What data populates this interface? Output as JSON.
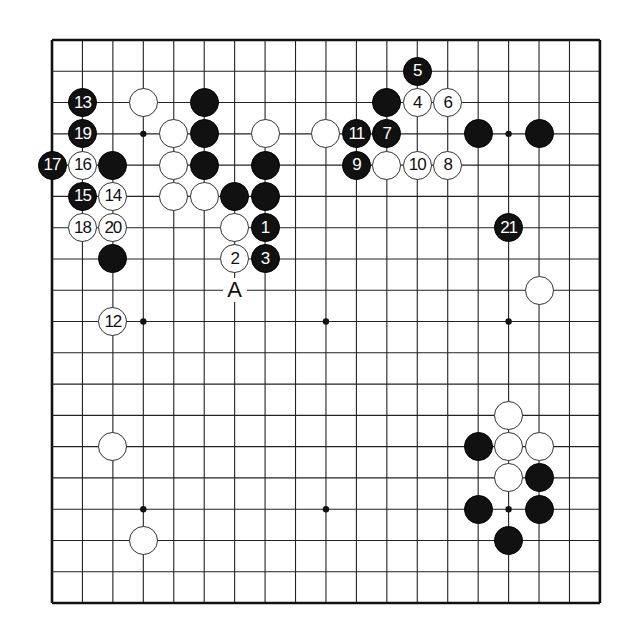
{
  "board": {
    "size": 19,
    "origin": {
      "x": 52,
      "y": 40
    },
    "spacing": {
      "x": 30.44,
      "y": 31.28
    },
    "line_color": "#222222",
    "border_color": "#111111",
    "star_points": [
      [
        3,
        3
      ],
      [
        9,
        3
      ],
      [
        15,
        3
      ],
      [
        3,
        9
      ],
      [
        9,
        9
      ],
      [
        15,
        9
      ],
      [
        3,
        15
      ],
      [
        9,
        15
      ],
      [
        15,
        15
      ]
    ]
  },
  "stones": [
    {
      "color": "black",
      "col": 12,
      "row": 1,
      "number": "5"
    },
    {
      "color": "black",
      "col": 1,
      "row": 2,
      "number": "13"
    },
    {
      "color": "white",
      "col": 3,
      "row": 2,
      "number": ""
    },
    {
      "color": "black",
      "col": 5,
      "row": 2,
      "number": ""
    },
    {
      "color": "black",
      "col": 11,
      "row": 2,
      "number": ""
    },
    {
      "color": "white",
      "col": 12,
      "row": 2,
      "number": "4"
    },
    {
      "color": "white",
      "col": 13,
      "row": 2,
      "number": "6"
    },
    {
      "color": "black",
      "col": 1,
      "row": 3,
      "number": "19"
    },
    {
      "color": "white",
      "col": 4,
      "row": 3,
      "number": ""
    },
    {
      "color": "black",
      "col": 5,
      "row": 3,
      "number": ""
    },
    {
      "color": "white",
      "col": 7,
      "row": 3,
      "number": ""
    },
    {
      "color": "white",
      "col": 9,
      "row": 3,
      "number": ""
    },
    {
      "color": "black",
      "col": 10,
      "row": 3,
      "number": "11"
    },
    {
      "color": "black",
      "col": 11,
      "row": 3,
      "number": "7"
    },
    {
      "color": "black",
      "col": 14,
      "row": 3,
      "number": ""
    },
    {
      "color": "black",
      "col": 16,
      "row": 3,
      "number": ""
    },
    {
      "color": "black",
      "col": 0,
      "row": 4,
      "number": "17"
    },
    {
      "color": "white",
      "col": 1,
      "row": 4,
      "number": "16"
    },
    {
      "color": "black",
      "col": 2,
      "row": 4,
      "number": ""
    },
    {
      "color": "white",
      "col": 4,
      "row": 4,
      "number": ""
    },
    {
      "color": "black",
      "col": 5,
      "row": 4,
      "number": ""
    },
    {
      "color": "black",
      "col": 7,
      "row": 4,
      "number": ""
    },
    {
      "color": "black",
      "col": 10,
      "row": 4,
      "number": "9"
    },
    {
      "color": "white",
      "col": 11,
      "row": 4,
      "number": ""
    },
    {
      "color": "white",
      "col": 12,
      "row": 4,
      "number": "10"
    },
    {
      "color": "white",
      "col": 13,
      "row": 4,
      "number": "8"
    },
    {
      "color": "black",
      "col": 1,
      "row": 5,
      "number": "15"
    },
    {
      "color": "white",
      "col": 2,
      "row": 5,
      "number": "14"
    },
    {
      "color": "white",
      "col": 4,
      "row": 5,
      "number": ""
    },
    {
      "color": "white",
      "col": 5,
      "row": 5,
      "number": ""
    },
    {
      "color": "black",
      "col": 6,
      "row": 5,
      "number": ""
    },
    {
      "color": "black",
      "col": 7,
      "row": 5,
      "number": ""
    },
    {
      "color": "white",
      "col": 1,
      "row": 6,
      "number": "18"
    },
    {
      "color": "white",
      "col": 2,
      "row": 6,
      "number": "20"
    },
    {
      "color": "white",
      "col": 6,
      "row": 6,
      "number": ""
    },
    {
      "color": "black",
      "col": 7,
      "row": 6,
      "number": "1"
    },
    {
      "color": "black",
      "col": 15,
      "row": 6,
      "number": "21"
    },
    {
      "color": "black",
      "col": 2,
      "row": 7,
      "number": ""
    },
    {
      "color": "white",
      "col": 6,
      "row": 7,
      "number": "2"
    },
    {
      "color": "black",
      "col": 7,
      "row": 7,
      "number": "3"
    },
    {
      "color": "white",
      "col": 16,
      "row": 8,
      "number": ""
    },
    {
      "color": "white",
      "col": 2,
      "row": 9,
      "number": "12"
    },
    {
      "color": "white",
      "col": 15,
      "row": 12,
      "number": ""
    },
    {
      "color": "white",
      "col": 2,
      "row": 13,
      "number": ""
    },
    {
      "color": "black",
      "col": 14,
      "row": 13,
      "number": ""
    },
    {
      "color": "white",
      "col": 15,
      "row": 13,
      "number": ""
    },
    {
      "color": "white",
      "col": 16,
      "row": 13,
      "number": ""
    },
    {
      "color": "white",
      "col": 15,
      "row": 14,
      "number": ""
    },
    {
      "color": "black",
      "col": 16,
      "row": 14,
      "number": ""
    },
    {
      "color": "black",
      "col": 14,
      "row": 15,
      "number": ""
    },
    {
      "color": "black",
      "col": 16,
      "row": 15,
      "number": ""
    },
    {
      "color": "white",
      "col": 3,
      "row": 16,
      "number": ""
    },
    {
      "color": "black",
      "col": 15,
      "row": 16,
      "number": ""
    }
  ],
  "labels": [
    {
      "text": "A",
      "col": 6,
      "row": 8
    }
  ]
}
